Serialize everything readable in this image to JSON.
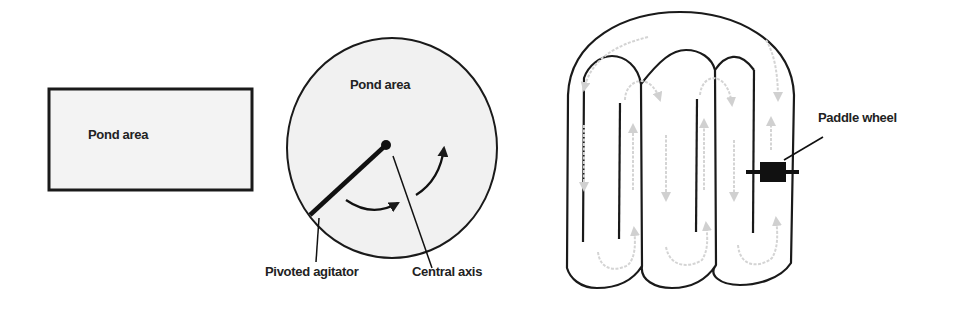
{
  "colors": {
    "stroke": "#1a1a1a",
    "pond_fill": "#f2f2f2",
    "flow_arrow": "#d4d4d4",
    "text": "#222222"
  },
  "panels": [
    {
      "id": "rectangular-pond",
      "labels": {
        "area": "Pond area"
      }
    },
    {
      "id": "circular-pond",
      "labels": {
        "area": "Pond area",
        "agitator": "Pivoted agitator",
        "axis": "Central axis"
      }
    },
    {
      "id": "raceway-pond",
      "labels": {
        "paddle": "Paddle wheel"
      }
    }
  ]
}
